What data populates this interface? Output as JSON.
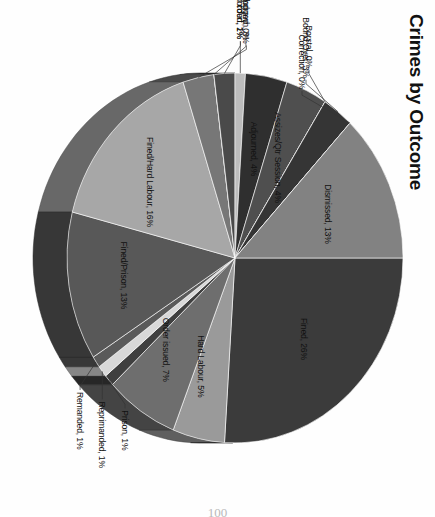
{
  "page": {
    "page_number": "100",
    "background_color": "#fefefe"
  },
  "chart_data": {
    "type": "pie",
    "title": "Crimes by Outcome",
    "xlabel": "",
    "ylabel": "",
    "legend_position": "none",
    "label_format": "name, percent",
    "three_d": true,
    "categories": [
      "Fined",
      "Hard Labour",
      "Order issued",
      "Prison",
      "Reprimanded",
      "Remanded",
      "Fined/Prison",
      "Fined/Hard Labour",
      "Withdrawn",
      "Fined/Flogged",
      "Settled out of court",
      "Not recorded",
      "Adjourned",
      "Assizes/Qtr Session",
      "Borstal",
      "Bound Over",
      "Correction",
      "Dismissed"
    ],
    "values": [
      26,
      5,
      7,
      1,
      1,
      1,
      13,
      16,
      3,
      0,
      2,
      1,
      4,
      4,
      0,
      3,
      0,
      13
    ],
    "labels": [
      "Fined, 26%",
      "Hard Labour, 5%",
      "Order issued, 7%",
      "Prison, 1%",
      "Reprimanded, 1%",
      "Remanded, 1%",
      "Fined/Prison, 13%",
      "Fined/Hard Labour, 16%",
      "Withdrawn, 3%",
      "Fined/Flogged, 0%",
      "Settled out of court, 2%",
      "Not recorded, 1%",
      "Adjourned, 4%",
      "Assizes/Qtr Session, 4%",
      "Borstal, 0%",
      "Bound Over, 3%",
      "Correction, 0%",
      "Dismissed, 13%"
    ],
    "colors": [
      "#3b3b3b",
      "#9a9a9a",
      "#6e6e6e",
      "#3f3f3f",
      "#d8d8d8",
      "#5a5a5a",
      "#585858",
      "#a7a7a7",
      "#777777",
      "#c9c9c9",
      "#4a4a4a",
      "#bdbdbd",
      "#2f2f2f",
      "#4f4f4f",
      "#8b8b8b",
      "#353535",
      "#9e9e9e",
      "#828282"
    ]
  }
}
